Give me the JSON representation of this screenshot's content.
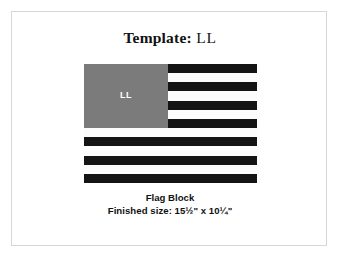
{
  "page": {
    "background_color": "#ffffff",
    "frame_border_color": "#d6d6d6"
  },
  "title": {
    "label_bold": "Template:",
    "label_plain": " LL",
    "full_text": "Template: LL"
  },
  "flag": {
    "canton": {
      "label": "LL",
      "fill_color": "#7b7b7b",
      "label_color": "#ffffff",
      "covers_stripes": 7
    },
    "colors": {
      "dark_stripe": "#141414",
      "light_stripe": "#fcfcfc"
    },
    "stripe_count": 13,
    "stripes": [
      {
        "index": 1,
        "tone": "dark"
      },
      {
        "index": 2,
        "tone": "light"
      },
      {
        "index": 3,
        "tone": "dark"
      },
      {
        "index": 4,
        "tone": "light"
      },
      {
        "index": 5,
        "tone": "dark"
      },
      {
        "index": 6,
        "tone": "light"
      },
      {
        "index": 7,
        "tone": "dark"
      },
      {
        "index": 8,
        "tone": "light"
      },
      {
        "index": 9,
        "tone": "dark"
      },
      {
        "index": 10,
        "tone": "light"
      },
      {
        "index": 11,
        "tone": "dark"
      },
      {
        "index": 12,
        "tone": "light"
      },
      {
        "index": 13,
        "tone": "dark"
      }
    ]
  },
  "caption": {
    "line1": "Flag Block",
    "line2": "Finished size: 15½\" x 10¼\"",
    "finished_width": "15½\"",
    "finished_height": "10¼\""
  }
}
